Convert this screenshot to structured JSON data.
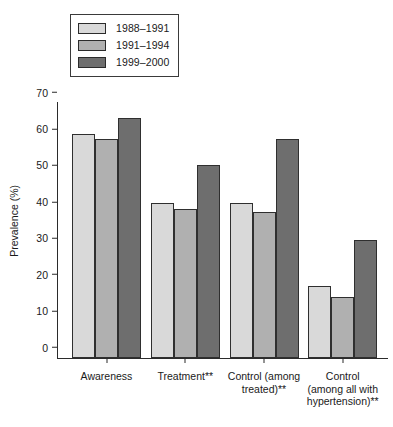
{
  "chart_data": {
    "type": "bar",
    "title": "",
    "xlabel": "",
    "ylabel": "Prevalence (%)",
    "ylim": [
      0,
      70
    ],
    "yticks": [
      0,
      10,
      20,
      30,
      40,
      50,
      60,
      70
    ],
    "grid": false,
    "legend_position": "top-left",
    "categories": [
      "Awareness",
      "Treatment**",
      "Control (among\ntreated)**",
      "Control\n(among all with\nhypertension)**"
    ],
    "series": [
      {
        "name": "1988–1991",
        "color": "#d9d9d9",
        "values": [
          61.5,
          42.5,
          42.5,
          19.8
        ]
      },
      {
        "name": "1991–1994",
        "color": "#b0b0b0",
        "values": [
          60.0,
          41.0,
          40.0,
          16.7
        ]
      },
      {
        "name": "1999–2000",
        "color": "#6e6e6e",
        "values": [
          66.0,
          53.0,
          60.0,
          32.5
        ]
      }
    ]
  },
  "colors": {
    "axis": "#2b2b2b",
    "bar_border": "#2f2f2f",
    "background": "#ffffff",
    "text": "#1a1a1a"
  }
}
